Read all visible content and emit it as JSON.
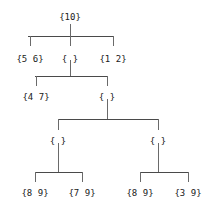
{
  "diagram": {
    "type": "tree",
    "title": "",
    "background_color": "#ffffff",
    "text_color": "#1a1a1a",
    "line_color": "#4a4a4a",
    "nodes": [
      {
        "id": "root",
        "label": "{10}",
        "x": 70,
        "y": 12,
        "depth": 0
      },
      {
        "id": "n1",
        "label": "{5 6}",
        "x": 30,
        "y": 54,
        "depth": 1
      },
      {
        "id": "n2",
        "label": "{ }",
        "x": 70,
        "y": 54,
        "depth": 1
      },
      {
        "id": "n3",
        "label": "{1 2}",
        "x": 113,
        "y": 54,
        "depth": 1
      },
      {
        "id": "n4",
        "label": "{4 7}",
        "x": 36,
        "y": 92,
        "depth": 2
      },
      {
        "id": "n5",
        "label": "{ }",
        "x": 107,
        "y": 92,
        "depth": 2
      },
      {
        "id": "n6",
        "label": "{ }",
        "x": 58,
        "y": 136,
        "depth": 3
      },
      {
        "id": "n7",
        "label": "{ }",
        "x": 158,
        "y": 136,
        "depth": 3
      },
      {
        "id": "l1",
        "label": "{8 9}",
        "x": 35,
        "y": 188,
        "depth": 4
      },
      {
        "id": "l2",
        "label": "{7 9}",
        "x": 82,
        "y": 188,
        "depth": 4
      },
      {
        "id": "l3",
        "label": "{8 9}",
        "x": 140,
        "y": 188,
        "depth": 4
      },
      {
        "id": "l4",
        "label": "{3 9}",
        "x": 188,
        "y": 188,
        "depth": 4
      }
    ],
    "edges": [
      {
        "parent": "root",
        "children": [
          "n1",
          "n2",
          "n3"
        ]
      },
      {
        "parent": "n2",
        "children": [
          "n4",
          "n5"
        ]
      },
      {
        "parent": "n5",
        "children": [
          "n6",
          "n7"
        ]
      },
      {
        "parent": "n6",
        "children": [
          "l1",
          "l2"
        ]
      },
      {
        "parent": "n7",
        "children": [
          "l3",
          "l4"
        ]
      }
    ],
    "connectors": {
      "bars": [
        {
          "id": "bar-root",
          "x1": 28,
          "x2": 113,
          "y": 36
        },
        {
          "id": "bar-n2",
          "x1": 35,
          "x2": 107,
          "y": 76
        },
        {
          "id": "bar-n5",
          "x1": 58,
          "x2": 158,
          "y": 119
        },
        {
          "id": "bar-n6",
          "x1": 35,
          "x2": 82,
          "y": 172
        },
        {
          "id": "bar-n7",
          "x1": 140,
          "x2": 188,
          "y": 172
        }
      ],
      "ticks": [
        {
          "id": "tick-root-down",
          "x": 70,
          "y1": 24,
          "y2": 36
        },
        {
          "id": "tick-n1-up",
          "x": 30,
          "y1": 36,
          "y2": 46
        },
        {
          "id": "tick-n2-up",
          "x": 70,
          "y1": 36,
          "y2": 46
        },
        {
          "id": "tick-n3-up",
          "x": 113,
          "y1": 36,
          "y2": 46
        },
        {
          "id": "tick-n2-down",
          "x": 70,
          "y1": 60,
          "y2": 76
        },
        {
          "id": "tick-n4-up",
          "x": 36,
          "y1": 76,
          "y2": 86
        },
        {
          "id": "tick-n5-up",
          "x": 107,
          "y1": 76,
          "y2": 86
        },
        {
          "id": "tick-n5-down",
          "x": 107,
          "y1": 99,
          "y2": 119
        },
        {
          "id": "tick-n6-up",
          "x": 58,
          "y1": 119,
          "y2": 130
        },
        {
          "id": "tick-n7-up",
          "x": 158,
          "y1": 119,
          "y2": 130
        },
        {
          "id": "tick-n6-down",
          "x": 58,
          "y1": 143,
          "y2": 172
        },
        {
          "id": "tick-n7-down",
          "x": 158,
          "y1": 143,
          "y2": 172
        },
        {
          "id": "tick-l1-up",
          "x": 35,
          "y1": 172,
          "y2": 182
        },
        {
          "id": "tick-l2-up",
          "x": 82,
          "y1": 172,
          "y2": 182
        },
        {
          "id": "tick-l3-up",
          "x": 140,
          "y1": 172,
          "y2": 182
        },
        {
          "id": "tick-l4-up",
          "x": 188,
          "y1": 172,
          "y2": 182
        }
      ]
    }
  }
}
